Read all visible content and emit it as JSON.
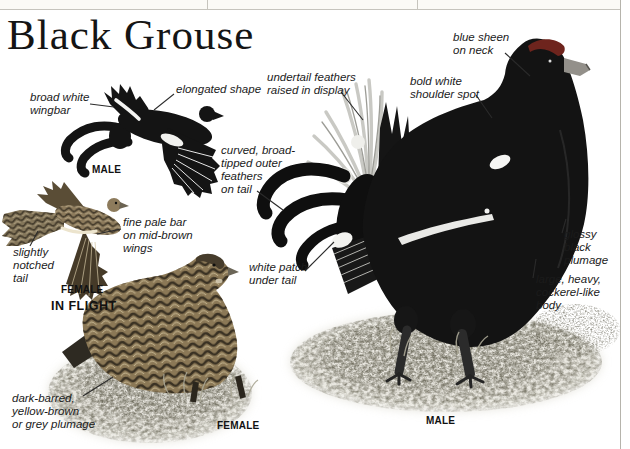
{
  "page": {
    "title": "Black Grouse"
  },
  "captions": {
    "flying_male": "MALE",
    "flying_female": "FEMALE",
    "in_flight": "IN FLIGHT",
    "standing_female": "FEMALE",
    "standing_male": "MALE"
  },
  "callouts": {
    "broad_white_wingbar": "broad white\nwingbar",
    "elongated_shape": "elongated shape",
    "undertail_feathers": "undertail feathers\nraised in display",
    "curved_outer_feathers": "curved, broad-\ntipped outer\nfeathers\non tail",
    "fine_pale_bar": "fine pale bar\non mid-brown\nwings",
    "slightly_notched_tail": "slightly\nnotched\ntail",
    "white_patch_under_tail": "white patch\nunder tail",
    "blue_sheen_on_neck": "blue sheen\non neck",
    "bold_white_shoulder_spot": "bold white\nshoulder spot",
    "glossy_black_plumage": "glossy\nblack\nplumage",
    "large_heavy_body": "large, heavy,\ncockerel-like\nbody",
    "dark_barred_plumage": "dark-barred,\nyellow-brown\nor grey plumage"
  },
  "colors": {
    "male_plumage": "#131313",
    "comb_red": "#6e241d",
    "female_plumage": "#8b7856",
    "female_bar_dark": "#352d20",
    "grass_speckle": "#6b685a",
    "page_edge_line": "#b6b4ac"
  }
}
